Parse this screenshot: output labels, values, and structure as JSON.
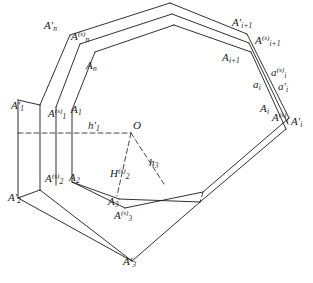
{
  "figure": {
    "stroke_color": "#1a1a1a",
    "background_color": "#ffffff",
    "labels": [
      {
        "id": "An_prime",
        "base": "A",
        "sub": "n",
        "sup": "",
        "prime": true,
        "x": 44,
        "y": 20
      },
      {
        "id": "An_s",
        "base": "A",
        "sub": "n",
        "sup": "(s)",
        "prime": false,
        "x": 71,
        "y": 31
      },
      {
        "id": "An",
        "base": "A",
        "sub": "n",
        "sup": "",
        "prime": false,
        "x": 86,
        "y": 60
      },
      {
        "id": "Ai1_prime",
        "base": "A",
        "sub": "i+1",
        "sup": "",
        "prime": true,
        "x": 232,
        "y": 17
      },
      {
        "id": "Ai1_s",
        "base": "A",
        "sub": "i+1",
        "sup": "(s)",
        "prime": false,
        "x": 255,
        "y": 35
      },
      {
        "id": "Ai1",
        "base": "A",
        "sub": "i+1",
        "sup": "",
        "prime": false,
        "x": 222,
        "y": 52
      },
      {
        "id": "ai_s",
        "base": "a",
        "sub": "i",
        "sup": "(s)",
        "prime": false,
        "x": 271,
        "y": 67
      },
      {
        "id": "ai",
        "base": "a",
        "sub": "i",
        "sup": "",
        "prime": false,
        "x": 253,
        "y": 79
      },
      {
        "id": "ai_prime",
        "base": "a",
        "sub": "i",
        "sup": "",
        "prime": true,
        "x": 278,
        "y": 81
      },
      {
        "id": "Ai",
        "base": "A",
        "sub": "i",
        "sup": "",
        "prime": false,
        "x": 260,
        "y": 103
      },
      {
        "id": "Ai_s",
        "base": "A",
        "sub": "i",
        "sup": "(s)",
        "prime": false,
        "x": 272,
        "y": 112
      },
      {
        "id": "Ai_prime",
        "base": "A",
        "sub": "i",
        "sup": "",
        "prime": true,
        "x": 291,
        "y": 116
      },
      {
        "id": "A1_prime",
        "base": "A",
        "sub": "1",
        "sup": "",
        "prime": true,
        "x": 11,
        "y": 100
      },
      {
        "id": "A1_s",
        "base": "A",
        "sub": "1",
        "sup": "(s)",
        "prime": false,
        "x": 48,
        "y": 108
      },
      {
        "id": "A1",
        "base": "A",
        "sub": "1",
        "sup": "",
        "prime": false,
        "x": 71,
        "y": 104
      },
      {
        "id": "h1_prime",
        "base": "h",
        "sub": "1",
        "sup": "",
        "prime": true,
        "x": 88,
        "y": 120
      },
      {
        "id": "O",
        "base": "O",
        "sub": "",
        "sup": "",
        "prime": false,
        "x": 133,
        "y": 120
      },
      {
        "id": "h3",
        "base": "h",
        "sub": "3",
        "sup": "",
        "prime": false,
        "x": 149,
        "y": 157
      },
      {
        "id": "H2_s",
        "base": "H",
        "sub": "2",
        "sup": "(s)",
        "prime": false,
        "x": 110,
        "y": 168
      },
      {
        "id": "A2_s",
        "base": "A",
        "sub": "2",
        "sup": "(s)",
        "prime": false,
        "x": 45,
        "y": 173
      },
      {
        "id": "A2",
        "base": "A",
        "sub": "2",
        "sup": "",
        "prime": false,
        "x": 69,
        "y": 172
      },
      {
        "id": "A2_prime",
        "base": "A",
        "sub": "2",
        "sup": "",
        "prime": true,
        "x": 8,
        "y": 192
      },
      {
        "id": "A3",
        "base": "A",
        "sub": "3",
        "sup": "",
        "prime": false,
        "x": 108,
        "y": 196
      },
      {
        "id": "A3_s",
        "base": "A",
        "sub": "3",
        "sup": "(s)",
        "prime": false,
        "x": 114,
        "y": 210
      },
      {
        "id": "A3_prime",
        "base": "A",
        "sub": "3",
        "sup": "",
        "prime": true,
        "x": 123,
        "y": 256
      }
    ],
    "geometry": {
      "solid_lines": [
        "M18,100 L40,105",
        "M18,100 L18,198",
        "M18,198 L40,190",
        "M40,105 L40,190",
        "M56,107 L56,185",
        "M72,110 L72,182",
        "M40,105 L70,35",
        "M56,107 L80,44",
        "M72,110 L95,52",
        "M70,35 L170,3",
        "M80,44 L172,14",
        "M95,52 L174,25",
        "M170,3 L247,34",
        "M172,14 L249,43",
        "M174,25 L251,52",
        "M247,34 L289,118",
        "M249,43 L288,124",
        "M251,52 L286,129",
        "M289,118 L203,192",
        "M286,129 L200,202",
        "M18,198 L132,261",
        "M40,190 L132,261",
        "M72,182 L125,208",
        "M125,208 L203,192",
        "M132,261 L200,202",
        "M72,182 L119,199",
        "M119,199 L200,202"
      ],
      "dashed_lines": [
        "M18,133 L131,133",
        "M131,133 L117,196",
        "M131,133 L164,184",
        "M203,192 L200,202"
      ]
    }
  }
}
